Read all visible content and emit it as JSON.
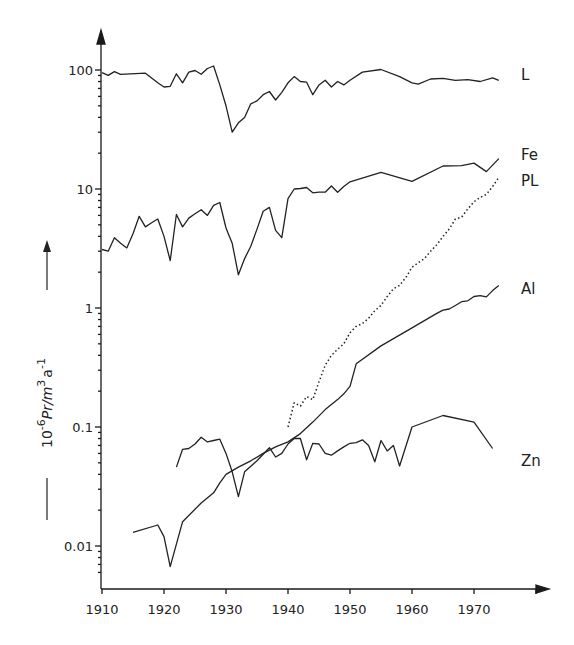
{
  "chart_data": {
    "type": "line",
    "title": "",
    "xlabel": "",
    "ylabel": "10^-6 Pr / m^3 a^-1",
    "ylabel_parts": {
      "base": "10",
      "exp1": "-6",
      "mid": "Pr/m",
      "exp2": "3",
      "unit": "a",
      "exp3": "-1"
    },
    "yscale": "log",
    "xlim": [
      1910,
      1980
    ],
    "ylim": [
      0.005,
      200
    ],
    "grid": false,
    "x_ticks": [
      1910,
      1920,
      1930,
      1940,
      1950,
      1960,
      1970
    ],
    "x_tick_labels": [
      "1910",
      "1920",
      "1930",
      "1940",
      "1950",
      "1960",
      "1970"
    ],
    "y_ticks": [
      0.01,
      0.1,
      1,
      10,
      100
    ],
    "y_tick_labels": [
      "0.01",
      "0.1",
      "1",
      "10",
      "100"
    ],
    "legend_position": "right end of each line",
    "series": [
      {
        "name": "L",
        "style": "solid",
        "x": [
          1910,
          1911,
          1912,
          1913,
          1917,
          1919,
          1920,
          1921,
          1922,
          1923,
          1924,
          1925,
          1926,
          1927,
          1928,
          1929,
          1930,
          1931,
          1932,
          1933,
          1934,
          1935,
          1936,
          1937,
          1938,
          1939,
          1940,
          1941,
          1942,
          1943,
          1944,
          1945,
          1946,
          1947,
          1948,
          1949,
          1950,
          1952,
          1955,
          1958,
          1960,
          1961,
          1963,
          1965,
          1967,
          1969,
          1971,
          1973,
          1974
        ],
        "values": [
          95,
          90,
          97,
          92,
          94,
          78,
          72,
          73,
          93,
          78,
          96,
          99,
          92,
          103,
          108,
          75,
          50,
          30,
          36,
          40,
          52,
          55,
          62,
          66,
          56,
          65,
          78,
          88,
          80,
          79,
          62,
          75,
          82,
          72,
          80,
          75,
          82,
          96,
          101,
          88,
          78,
          76,
          84,
          85,
          82,
          83,
          80,
          86,
          82
        ]
      },
      {
        "name": "Fe",
        "style": "solid",
        "x": [
          1910,
          1911,
          1912,
          1913,
          1914,
          1915,
          1916,
          1917,
          1918,
          1919,
          1920,
          1921,
          1922,
          1923,
          1924,
          1925,
          1926,
          1927,
          1928,
          1929,
          1930,
          1931,
          1932,
          1933,
          1934,
          1935,
          1936,
          1937,
          1938,
          1939,
          1940,
          1941,
          1942,
          1943,
          1944,
          1945,
          1946,
          1947,
          1948,
          1949,
          1950,
          1955,
          1960,
          1965,
          1968,
          1970,
          1972,
          1974
        ],
        "values": [
          3.1,
          3.0,
          3.9,
          3.5,
          3.2,
          4.2,
          5.9,
          4.8,
          5.2,
          5.6,
          4.0,
          2.5,
          6.1,
          4.8,
          5.7,
          6.2,
          6.7,
          6.0,
          7.3,
          7.7,
          4.7,
          3.5,
          1.9,
          2.6,
          3.3,
          4.6,
          6.5,
          7.0,
          4.5,
          3.9,
          8.3,
          10.0,
          10.1,
          10.3,
          9.3,
          9.4,
          9.4,
          10.6,
          9.4,
          10.5,
          11.5,
          13.8,
          11.6,
          15.6,
          15.7,
          16.5,
          14.0,
          18.0
        ]
      },
      {
        "name": "PL",
        "style": "dotted",
        "x": [
          1940,
          1941,
          1942,
          1943,
          1944,
          1945,
          1946,
          1947,
          1948,
          1949,
          1950,
          1951,
          1952,
          1953,
          1954,
          1955,
          1956,
          1957,
          1958,
          1959,
          1960,
          1961,
          1962,
          1963,
          1964,
          1965,
          1966,
          1967,
          1968,
          1969,
          1970,
          1971,
          1972,
          1973,
          1974
        ],
        "values": [
          0.1,
          0.16,
          0.15,
          0.18,
          0.17,
          0.24,
          0.33,
          0.4,
          0.45,
          0.5,
          0.62,
          0.7,
          0.74,
          0.82,
          0.95,
          1.05,
          1.25,
          1.45,
          1.55,
          1.8,
          2.2,
          2.4,
          2.6,
          3.0,
          3.4,
          4.0,
          4.6,
          5.6,
          5.8,
          6.8,
          7.8,
          8.5,
          9.0,
          10.5,
          12.5
        ]
      },
      {
        "name": "Al",
        "style": "solid",
        "x": [
          1915,
          1919,
          1920,
          1921,
          1923,
          1926,
          1928,
          1929,
          1930,
          1932,
          1934,
          1936,
          1938,
          1940,
          1942,
          1944,
          1946,
          1948,
          1949,
          1950,
          1951,
          1955,
          1960,
          1964,
          1965,
          1966,
          1967,
          1968,
          1969,
          1970,
          1971,
          1972,
          1973,
          1974
        ],
        "values": [
          0.013,
          0.015,
          0.012,
          0.0067,
          0.016,
          0.023,
          0.028,
          0.034,
          0.04,
          0.046,
          0.052,
          0.06,
          0.068,
          0.075,
          0.088,
          0.11,
          0.14,
          0.17,
          0.19,
          0.22,
          0.34,
          0.48,
          0.68,
          0.9,
          0.96,
          0.98,
          1.05,
          1.13,
          1.15,
          1.25,
          1.27,
          1.24,
          1.4,
          1.55
        ]
      },
      {
        "name": "Zn",
        "style": "solid",
        "x": [
          1922,
          1923,
          1924,
          1925,
          1926,
          1927,
          1928,
          1929,
          1930,
          1931,
          1932,
          1933,
          1935,
          1937,
          1938,
          1939,
          1940,
          1941,
          1942,
          1943,
          1944,
          1945,
          1946,
          1947,
          1948,
          1949,
          1950,
          1951,
          1952,
          1953,
          1954,
          1955,
          1956,
          1957,
          1958,
          1960,
          1965,
          1970,
          1973
        ],
        "values": [
          0.046,
          0.065,
          0.066,
          0.072,
          0.082,
          0.075,
          0.077,
          0.079,
          0.06,
          0.042,
          0.026,
          0.042,
          0.052,
          0.067,
          0.056,
          0.06,
          0.072,
          0.08,
          0.08,
          0.053,
          0.073,
          0.072,
          0.06,
          0.058,
          0.063,
          0.068,
          0.073,
          0.074,
          0.078,
          0.07,
          0.051,
          0.077,
          0.063,
          0.07,
          0.047,
          0.1,
          0.125,
          0.11,
          0.066
        ]
      }
    ]
  },
  "axes": {
    "x_origin_px": 102,
    "px_per_year": 6.2,
    "y_top_decade_px": 70,
    "px_per_decade": 119
  },
  "labels": {
    "L": "L",
    "Fe": "Fe",
    "PL": "PL",
    "Al": "Al",
    "Zn": "Zn"
  }
}
